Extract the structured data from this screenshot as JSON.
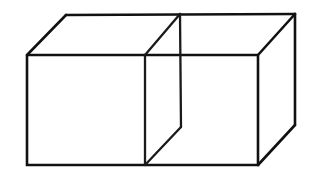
{
  "figure": {
    "title": "Two-cube rectangular box line drawing",
    "background_color": "#ffffff",
    "line_color": "#111111",
    "line_width_px": 2.6,
    "canvas": {
      "width": 313,
      "height": 174
    },
    "projection": {
      "type": "oblique",
      "depth_offset_x": 38,
      "depth_offset_y": -41
    },
    "vertices": {
      "front_top_left": {
        "x": 27,
        "y": 55
      },
      "front_top_right": {
        "x": 258,
        "y": 55
      },
      "front_bottom_right": {
        "x": 258,
        "y": 165
      },
      "front_bottom_left": {
        "x": 27,
        "y": 165
      },
      "back_top_left": {
        "x": 66,
        "y": 15
      },
      "back_top_right": {
        "x": 295,
        "y": 14
      },
      "back_bottom_right": {
        "x": 295,
        "y": 125
      },
      "partition_top_back": {
        "x": 180,
        "y": 14
      },
      "partition_top_front": {
        "x": 145,
        "y": 55
      },
      "partition_bottom_front": {
        "x": 145,
        "y": 165
      },
      "partition_bottom_back": {
        "x": 181,
        "y": 127
      }
    },
    "edges": [
      {
        "name": "front-face-outline",
        "points": "27,55 258,55 258,165 27,165 27,55"
      },
      {
        "name": "top-back-edge",
        "points": "66,15 295,14"
      },
      {
        "name": "top-left-receding-edge",
        "points": "27,55 66,15"
      },
      {
        "name": "top-right-receding-edge",
        "points": "258,55 295,14"
      },
      {
        "name": "right-back-vertical-edge",
        "points": "295,14 295,125"
      },
      {
        "name": "bottom-right-receding-edge",
        "points": "258,165 295,125"
      },
      {
        "name": "partition-top-receding-edge",
        "points": "145,55 180,14"
      },
      {
        "name": "partition-back-vertical-edge",
        "points": "180,14 181,127"
      },
      {
        "name": "partition-front-vertical-edge",
        "points": "145,55 145,165"
      },
      {
        "name": "partition-bottom-receding-edge",
        "points": "145,165 181,127"
      }
    ],
    "faces": [
      {
        "name": "front-face",
        "points": "27,55 258,55 258,165 27,165"
      },
      {
        "name": "top-face",
        "points": "27,55 66,15 295,14 258,55"
      },
      {
        "name": "right-face",
        "points": "258,55 295,14 295,125 258,165"
      },
      {
        "name": "partition-face",
        "points": "145,55 180,14 181,127 145,165"
      }
    ]
  }
}
